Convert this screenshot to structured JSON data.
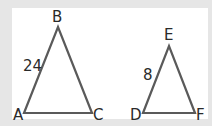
{
  "diagram": {
    "triangle_1": {
      "vertices": {
        "A": "A",
        "B": "B",
        "C": "C"
      },
      "side_AB_label": "24"
    },
    "triangle_2": {
      "vertices": {
        "D": "D",
        "E": "E",
        "F": "F"
      },
      "side_DE_label": "8"
    },
    "colors": {
      "stroke": "#5a5a5a",
      "background": "#e6e6e6",
      "panel": "#ffffff"
    }
  }
}
